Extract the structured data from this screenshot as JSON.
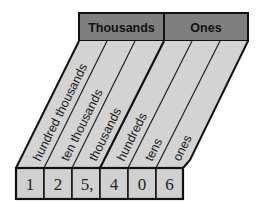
{
  "chart": {
    "groups": [
      {
        "label": "Thousands"
      },
      {
        "label": "Ones"
      }
    ],
    "columns": [
      {
        "label": "hundred thousands",
        "digit": "1"
      },
      {
        "label": "ten thousands",
        "digit": "2"
      },
      {
        "label": "thousands",
        "digit": "5,"
      },
      {
        "label": "hundreds",
        "digit": "4"
      },
      {
        "label": "tens",
        "digit": "0"
      },
      {
        "label": "ones",
        "digit": "6"
      }
    ],
    "number": "125,406"
  },
  "colors": {
    "header_fill": "#7f7f7f",
    "column_fill": "#d3d3d3",
    "box_fill": "#d0d0d0",
    "stroke": "#111111"
  }
}
